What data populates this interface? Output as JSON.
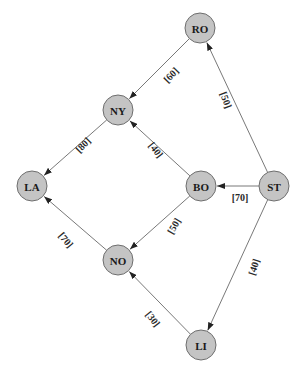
{
  "diagram": {
    "type": "directed-weighted-graph",
    "colors": {
      "node_fill": "#c4c4c4",
      "node_stroke": "#6e6e6e",
      "edge": "#555555",
      "text": "#1a1a1a"
    },
    "node_radius": 15,
    "nodes": [
      {
        "id": "RO",
        "label": "RO",
        "x": 200,
        "y": 28
      },
      {
        "id": "NY",
        "label": "NY",
        "x": 118,
        "y": 110
      },
      {
        "id": "LA",
        "label": "LA",
        "x": 32,
        "y": 186
      },
      {
        "id": "BO",
        "label": "BO",
        "x": 201,
        "y": 186
      },
      {
        "id": "ST",
        "label": "ST",
        "x": 274,
        "y": 186
      },
      {
        "id": "NO",
        "label": "NO",
        "x": 118,
        "y": 260
      },
      {
        "id": "LI",
        "label": "LI",
        "x": 201,
        "y": 345
      }
    ],
    "edges": [
      {
        "from": "RO",
        "to": "NY",
        "label": "[60]",
        "lx": 171,
        "ly": 75,
        "rot": -46
      },
      {
        "from": "NY",
        "to": "LA",
        "label": "[80]",
        "lx": 83,
        "ly": 145,
        "rot": -46
      },
      {
        "from": "BO",
        "to": "NY",
        "label": "[40]",
        "lx": 156,
        "ly": 150,
        "rot": 52
      },
      {
        "from": "ST",
        "to": "RO",
        "label": "[50]",
        "lx": 226,
        "ly": 100,
        "rot": 70
      },
      {
        "from": "ST",
        "to": "BO",
        "label": "[70]",
        "lx": 240,
        "ly": 197,
        "rot": 0
      },
      {
        "from": "BO",
        "to": "NO",
        "label": "[50]",
        "lx": 174,
        "ly": 226,
        "rot": -60
      },
      {
        "from": "NO",
        "to": "LA",
        "label": "[70]",
        "lx": 66,
        "ly": 240,
        "rot": 50
      },
      {
        "from": "ST",
        "to": "LI",
        "label": "[40]",
        "lx": 254,
        "ly": 267,
        "rot": -72
      },
      {
        "from": "LI",
        "to": "NO",
        "label": "[30]",
        "lx": 153,
        "ly": 319,
        "rot": 52
      }
    ]
  }
}
